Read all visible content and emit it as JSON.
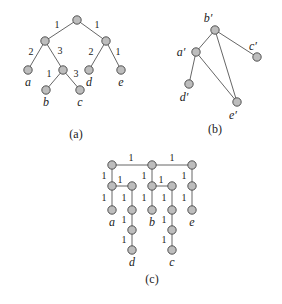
{
  "figure_a": {
    "caption": "(a)",
    "nodes": [
      {
        "id": "r",
        "x": 77,
        "y": 20,
        "label": ""
      },
      {
        "id": "L",
        "x": 45,
        "y": 41,
        "label": ""
      },
      {
        "id": "R",
        "x": 106,
        "y": 41,
        "label": ""
      },
      {
        "id": "a",
        "x": 28,
        "y": 70,
        "label": "a"
      },
      {
        "id": "M",
        "x": 63,
        "y": 70,
        "label": ""
      },
      {
        "id": "d",
        "x": 89,
        "y": 70,
        "label": "d"
      },
      {
        "id": "e",
        "x": 121,
        "y": 70,
        "label": "e"
      },
      {
        "id": "b",
        "x": 46,
        "y": 90,
        "label": "b"
      },
      {
        "id": "c",
        "x": 80,
        "y": 90,
        "label": "c"
      }
    ],
    "edges": [
      {
        "from": "r",
        "to": "L",
        "weight": "1",
        "lx": 57,
        "ly": 28
      },
      {
        "from": "r",
        "to": "R",
        "weight": "1",
        "lx": 97,
        "ly": 28
      },
      {
        "from": "L",
        "to": "a",
        "weight": "2",
        "lx": 31,
        "ly": 55
      },
      {
        "from": "L",
        "to": "M",
        "weight": "3",
        "lx": 60,
        "ly": 54
      },
      {
        "from": "R",
        "to": "d",
        "weight": "2",
        "lx": 91,
        "ly": 55
      },
      {
        "from": "R",
        "to": "e",
        "weight": "1",
        "lx": 118,
        "ly": 55
      },
      {
        "from": "M",
        "to": "b",
        "weight": "1",
        "lx": 49,
        "ly": 77
      },
      {
        "from": "M",
        "to": "c",
        "weight": "3",
        "lx": 76,
        "ly": 77
      }
    ]
  },
  "figure_b": {
    "caption": "(b)",
    "nodes": [
      {
        "id": "b'",
        "x": 215,
        "y": 30,
        "label": "b′",
        "lx": 208,
        "ly": 22
      },
      {
        "id": "a'",
        "x": 196,
        "y": 52,
        "label": "a′",
        "lx": 181,
        "ly": 56
      },
      {
        "id": "c'",
        "x": 257,
        "y": 57,
        "label": "c′",
        "lx": 253,
        "ly": 50
      },
      {
        "id": "d'",
        "x": 189,
        "y": 84,
        "label": "d′",
        "lx": 184,
        "ly": 101
      },
      {
        "id": "e'",
        "x": 237,
        "y": 102,
        "label": "e′",
        "lx": 233,
        "ly": 119
      }
    ],
    "edges": [
      {
        "from": "b'",
        "to": "a'"
      },
      {
        "from": "b'",
        "to": "c'"
      },
      {
        "from": "b'",
        "to": "e'"
      },
      {
        "from": "a'",
        "to": "d'"
      },
      {
        "from": "a'",
        "to": "e'"
      }
    ]
  },
  "figure_c": {
    "caption": "(c)",
    "nodes": [
      {
        "id": "t1",
        "x": 112,
        "y": 165,
        "label": ""
      },
      {
        "id": "t2",
        "x": 152,
        "y": 165,
        "label": ""
      },
      {
        "id": "t3",
        "x": 192,
        "y": 165,
        "label": ""
      },
      {
        "id": "m1",
        "x": 112,
        "y": 186,
        "label": ""
      },
      {
        "id": "m2",
        "x": 132,
        "y": 186,
        "label": ""
      },
      {
        "id": "m3",
        "x": 152,
        "y": 186,
        "label": ""
      },
      {
        "id": "m4",
        "x": 172,
        "y": 186,
        "label": ""
      },
      {
        "id": "m5",
        "x": 192,
        "y": 186,
        "label": ""
      },
      {
        "id": "a",
        "x": 112,
        "y": 210,
        "label": "a"
      },
      {
        "id": "n2",
        "x": 132,
        "y": 210,
        "label": ""
      },
      {
        "id": "b",
        "x": 152,
        "y": 210,
        "label": "b"
      },
      {
        "id": "n4",
        "x": 172,
        "y": 210,
        "label": ""
      },
      {
        "id": "e",
        "x": 192,
        "y": 210,
        "label": "e"
      },
      {
        "id": "p2",
        "x": 132,
        "y": 230,
        "label": ""
      },
      {
        "id": "p4",
        "x": 172,
        "y": 230,
        "label": ""
      },
      {
        "id": "d",
        "x": 132,
        "y": 250,
        "label": "d"
      },
      {
        "id": "c",
        "x": 172,
        "y": 250,
        "label": "c"
      }
    ],
    "edges": [
      {
        "from": "t1",
        "to": "t2",
        "weight": "1",
        "lx": 131,
        "ly": 161
      },
      {
        "from": "t2",
        "to": "t3",
        "weight": "1",
        "lx": 172,
        "ly": 161
      },
      {
        "from": "t1",
        "to": "m1",
        "weight": "1",
        "lx": 104,
        "ly": 179
      },
      {
        "from": "t2",
        "to": "m3",
        "weight": "1",
        "lx": 144,
        "ly": 179
      },
      {
        "from": "t3",
        "to": "m5",
        "weight": "1",
        "lx": 184,
        "ly": 179
      },
      {
        "from": "m1",
        "to": "m2",
        "weight": "1",
        "lx": 120,
        "ly": 183
      },
      {
        "from": "m3",
        "to": "m4",
        "weight": "1",
        "lx": 161,
        "ly": 183
      },
      {
        "from": "m1",
        "to": "a",
        "weight": "1",
        "lx": 104,
        "ly": 201
      },
      {
        "from": "m2",
        "to": "n2",
        "weight": "1",
        "lx": 124,
        "ly": 201
      },
      {
        "from": "m3",
        "to": "b",
        "weight": "1",
        "lx": 144,
        "ly": 201
      },
      {
        "from": "m4",
        "to": "n4",
        "weight": "1",
        "lx": 164,
        "ly": 201
      },
      {
        "from": "m5",
        "to": "e",
        "weight": "1",
        "lx": 184,
        "ly": 201
      },
      {
        "from": "n2",
        "to": "p2",
        "weight": "1",
        "lx": 124,
        "ly": 223
      },
      {
        "from": "n4",
        "to": "p4",
        "weight": "1",
        "lx": 164,
        "ly": 223
      },
      {
        "from": "p2",
        "to": "d",
        "weight": "1",
        "lx": 124,
        "ly": 243
      },
      {
        "from": "p4",
        "to": "c",
        "weight": "1",
        "lx": 164,
        "ly": 243
      }
    ]
  }
}
